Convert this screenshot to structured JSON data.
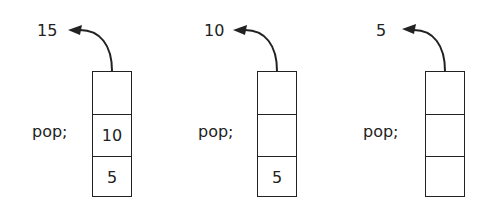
{
  "diagram": {
    "panels": [
      {
        "popped_value": "15",
        "operation": "pop;",
        "stack_cells": [
          "",
          "10",
          "5"
        ]
      },
      {
        "popped_value": "10",
        "operation": "pop;",
        "stack_cells": [
          "",
          "",
          "5"
        ]
      },
      {
        "popped_value": "5",
        "operation": "pop;",
        "stack_cells": [
          "",
          "",
          ""
        ]
      }
    ],
    "colors": {
      "stroke": "#222222",
      "background": "#ffffff"
    }
  }
}
